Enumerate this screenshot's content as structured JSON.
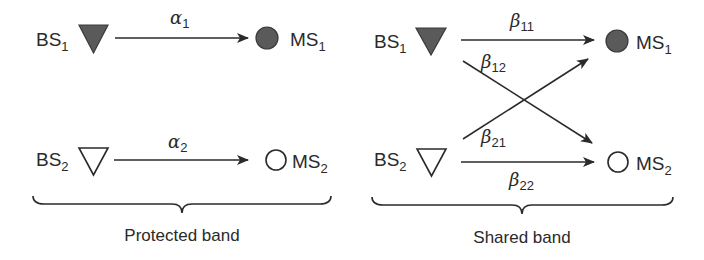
{
  "panels": [
    {
      "id": "protected",
      "caption": "Protected band",
      "nodes": {
        "bs1": {
          "base": "BS",
          "sub": "1",
          "symbol": "filled-triangle"
        },
        "bs2": {
          "base": "BS",
          "sub": "2",
          "symbol": "hollow-triangle"
        },
        "ms1": {
          "base": "MS",
          "sub": "1",
          "symbol": "filled-circle"
        },
        "ms2": {
          "base": "MS",
          "sub": "2",
          "symbol": "hollow-circle"
        }
      },
      "links": [
        {
          "from": "BS1",
          "to": "MS1",
          "greek": "α",
          "sub": "1"
        },
        {
          "from": "BS2",
          "to": "MS2",
          "greek": "α",
          "sub": "2"
        }
      ]
    },
    {
      "id": "shared",
      "caption": "Shared band",
      "nodes": {
        "bs1": {
          "base": "BS",
          "sub": "1",
          "symbol": "filled-triangle"
        },
        "bs2": {
          "base": "BS",
          "sub": "2",
          "symbol": "hollow-triangle"
        },
        "ms1": {
          "base": "MS",
          "sub": "1",
          "symbol": "filled-circle"
        },
        "ms2": {
          "base": "MS",
          "sub": "2",
          "symbol": "hollow-circle"
        }
      },
      "links": [
        {
          "from": "BS1",
          "to": "MS1",
          "greek": "β",
          "sub": "11"
        },
        {
          "from": "BS1",
          "to": "MS2",
          "greek": "β",
          "sub": "12"
        },
        {
          "from": "BS2",
          "to": "MS1",
          "greek": "β",
          "sub": "21"
        },
        {
          "from": "BS2",
          "to": "MS2",
          "greek": "β",
          "sub": "22"
        }
      ]
    }
  ],
  "colors": {
    "ink": "#2a2a2a",
    "filled_node": "#5a5a5a",
    "background": "#ffffff"
  }
}
